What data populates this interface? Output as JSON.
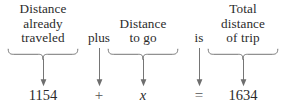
{
  "diagram": {
    "kind": "word-equation-to-algebra",
    "colors": {
      "text": "#2b2b2b",
      "rule": "#6e6e6e",
      "background": "#ffffff"
    },
    "columns": [
      {
        "id": "distance-already-traveled",
        "type": "phrase",
        "lines": [
          "Distance",
          "already",
          "traveled"
        ],
        "has_brace": true,
        "value": "1154"
      },
      {
        "id": "plus",
        "type": "connector",
        "word": "plus",
        "has_brace": false,
        "value": "+"
      },
      {
        "id": "distance-to-go",
        "type": "phrase",
        "lines": [
          "Distance",
          "to go"
        ],
        "has_brace": true,
        "value": "x"
      },
      {
        "id": "is",
        "type": "connector",
        "word": "is",
        "has_brace": false,
        "value": "="
      },
      {
        "id": "total-distance-of-trip",
        "type": "phrase",
        "lines": [
          "Total",
          "distance",
          "of trip"
        ],
        "has_brace": true,
        "value": "1634"
      }
    ],
    "equation": {
      "left_term": "1154",
      "operator": "+",
      "variable": "x",
      "relation": "=",
      "right_term": "1634",
      "full": "1154 + x = 1634"
    }
  }
}
